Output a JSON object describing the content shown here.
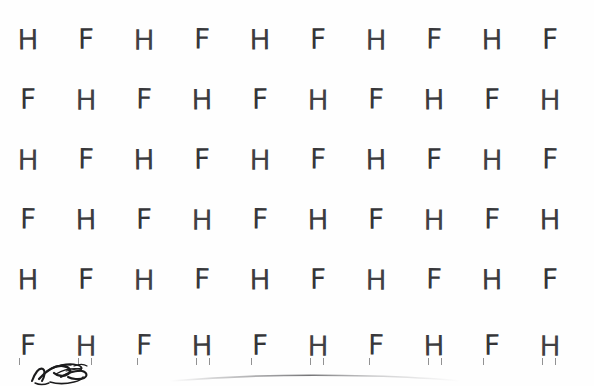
{
  "document": {
    "kind": "letter-cancellation-test-sheet",
    "background_color": "#fefefe",
    "ink_color": "#3a3a3c",
    "page_width": 594,
    "page_height": 386
  },
  "grid": {
    "columns": 10,
    "rows": 6,
    "column_x": [
      28,
      86,
      144,
      202,
      260,
      318,
      376,
      434,
      492,
      550
    ],
    "row_y": [
      14,
      74,
      134,
      194,
      254,
      320
    ],
    "glyph_font_size": 28,
    "rows_data": [
      {
        "index": 1,
        "letters": [
          "H",
          "F",
          "H",
          "F",
          "H",
          "F",
          "H",
          "F",
          "H",
          "F"
        ]
      },
      {
        "index": 2,
        "letters": [
          "F",
          "H",
          "F",
          "H",
          "F",
          "H",
          "F",
          "H",
          "F",
          "H"
        ]
      },
      {
        "index": 3,
        "letters": [
          "H",
          "F",
          "H",
          "F",
          "H",
          "F",
          "H",
          "F",
          "H",
          "F"
        ]
      },
      {
        "index": 4,
        "letters": [
          "F",
          "H",
          "F",
          "H",
          "F",
          "H",
          "F",
          "H",
          "F",
          "H"
        ]
      },
      {
        "index": 5,
        "letters": [
          "H",
          "F",
          "H",
          "F",
          "H",
          "F",
          "H",
          "F",
          "H",
          "F"
        ]
      },
      {
        "index": 6,
        "letters": [
          "F",
          "H",
          "F",
          "H",
          "F",
          "H",
          "F",
          "H",
          "F",
          "H"
        ]
      }
    ]
  },
  "clipped_row_above": {
    "letters": [
      "H",
      "F",
      "H",
      "F",
      "H",
      "F",
      "H",
      "F",
      "H",
      "F"
    ],
    "note": "only the lower few pixels of this row are visible at the very top of the crop"
  },
  "bottom_remnant_row": {
    "letters": [
      "F",
      "H",
      "F",
      "H",
      "F",
      "H",
      "F",
      "H",
      "F",
      "H"
    ],
    "note": "descender stubs of row 6 plus faint marks visible at the bottom crop edge"
  },
  "annotations": {
    "handwriting": {
      "name": "handwritten-scribble",
      "content": "",
      "legible": false,
      "color": "#1b1b1c",
      "position": {
        "x": 30,
        "y": 360
      }
    },
    "page_edge_shadow": {
      "name": "page-edge-shadow",
      "color": "#9a9a9d",
      "position": {
        "x": 170,
        "y": 371
      }
    }
  }
}
